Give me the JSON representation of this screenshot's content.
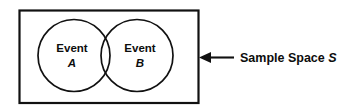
{
  "diagram": {
    "type": "venn-diagram",
    "sample_space": {
      "label_word": "Sample Space",
      "label_symbol": "S",
      "shape": "rectangle",
      "callout": "arrow-left"
    },
    "events": [
      {
        "word": "Event",
        "symbol": "A",
        "position": "left"
      },
      {
        "word": "Event",
        "symbol": "B",
        "position": "right"
      }
    ],
    "colors": {
      "stroke": "#111111",
      "text": "#0d0d0d",
      "background": "#ffffff"
    }
  }
}
